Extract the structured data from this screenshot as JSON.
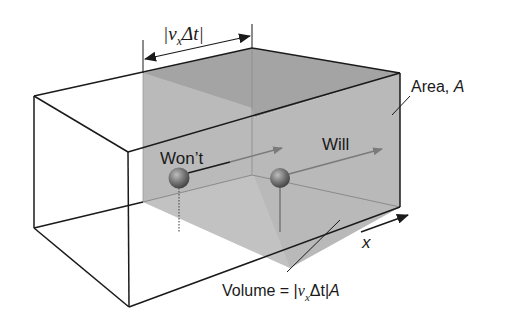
{
  "diagram": {
    "type": "3d-box-flux-volume",
    "labels": {
      "width_v": "v",
      "width_sub": "x",
      "width_delta": "Δt",
      "area_prefix": "Area, ",
      "area_var": "A",
      "wont": "Won’t",
      "will": "Will",
      "axis": "x",
      "volume_prefix": "Volume = |",
      "volume_v": "v",
      "volume_sub": "x",
      "volume_delta": "Δt|",
      "volume_var": "A"
    },
    "colors": {
      "edge": "#1a1a1a",
      "plane_light": "#c4c4c4",
      "volume_top": "#a6a6a6",
      "volume_front": "#b8b8b8",
      "volume_floor": "#d9d9d9",
      "volume_right": "#bfbfbf",
      "sphere": "#6e6e6e",
      "arrow": "#7a7a7a"
    }
  }
}
